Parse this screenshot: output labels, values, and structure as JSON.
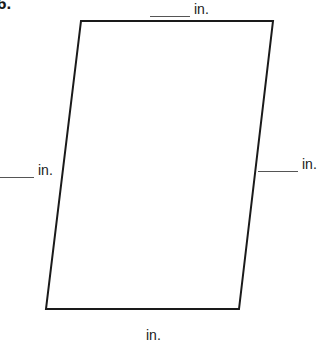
{
  "problem": {
    "number": "6.",
    "shape": "parallelogram",
    "vertices": {
      "top_left": [
        81,
        21
      ],
      "top_right": [
        273,
        21
      ],
      "bottom_right": [
        239,
        309
      ],
      "bottom_left": [
        46,
        309
      ]
    },
    "stroke_color": "#1a1a1a"
  },
  "labels": {
    "top": {
      "blank": "",
      "unit": "in."
    },
    "left": {
      "blank": "",
      "unit": "in."
    },
    "right": {
      "blank": "",
      "unit": "in."
    },
    "bottom": {
      "unit": "in."
    }
  }
}
